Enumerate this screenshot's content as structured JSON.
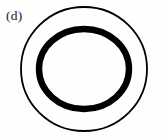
{
  "figure": {
    "panel_label": "(d)",
    "background_color": "#fefefe",
    "ink_color": "#000000",
    "label_color": "#1a1a1a"
  },
  "chart_data": {
    "type": "diagram",
    "title": "(d)",
    "shapes": [
      {
        "name": "outer-circle",
        "kind": "circle",
        "cx": 84,
        "cy": 69,
        "rx": 63,
        "ry": 62,
        "stroke": "#000000",
        "stroke_width": 1.8,
        "fill": "none"
      },
      {
        "name": "inner-ring",
        "kind": "circle",
        "cx": 84,
        "cy": 69,
        "rx": 45,
        "ry": 40,
        "stroke": "#000000",
        "stroke_width": 6.4,
        "fill": "none"
      }
    ],
    "annotations": [
      {
        "name": "panel-label",
        "text": "(d)",
        "x": 6,
        "y": 8
      }
    ],
    "xlabel": "",
    "ylabel": "",
    "legend": []
  }
}
